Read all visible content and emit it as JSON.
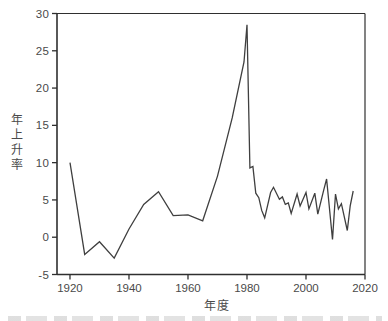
{
  "figure": {
    "background": "#ffffff",
    "axis_color": "#2f2f2f",
    "text_color": "#4a4a4a"
  },
  "chart_data": {
    "type": "line",
    "title": "",
    "xlabel": "年度",
    "ylabel": "年上升率",
    "x_ticks": [
      1920,
      1940,
      1960,
      1980,
      2000,
      2020
    ],
    "y_ticks": [
      30,
      25,
      20,
      15,
      10,
      5,
      0,
      -5
    ],
    "xlim": [
      1915.6,
      2020
    ],
    "ylim": [
      -5,
      30
    ],
    "grid": false,
    "legend": false,
    "line_color": "#3f3f3f",
    "series": [
      {
        "name": "年上升率",
        "points": [
          [
            1920,
            10.0
          ],
          [
            1925,
            -2.3
          ],
          [
            1930,
            -0.6
          ],
          [
            1935,
            -2.8
          ],
          [
            1940,
            1.1
          ],
          [
            1945,
            4.4
          ],
          [
            1950,
            6.1
          ],
          [
            1955,
            2.9
          ],
          [
            1960,
            3.0
          ],
          [
            1965,
            2.2
          ],
          [
            1970,
            8.2
          ],
          [
            1975,
            16.0
          ],
          [
            1979,
            23.5
          ],
          [
            1980,
            28.5
          ],
          [
            1981,
            9.3
          ],
          [
            1982,
            9.5
          ],
          [
            1983,
            5.9
          ],
          [
            1984,
            5.3
          ],
          [
            1985,
            3.6
          ],
          [
            1986,
            2.6
          ],
          [
            1988,
            6.0
          ],
          [
            1989,
            6.7
          ],
          [
            1991,
            5.1
          ],
          [
            1992,
            5.4
          ],
          [
            1993,
            4.4
          ],
          [
            1994,
            4.6
          ],
          [
            1995,
            3.2
          ],
          [
            1997,
            5.8
          ],
          [
            1998,
            4.2
          ],
          [
            2000,
            6.0
          ],
          [
            2001,
            3.8
          ],
          [
            2003,
            5.9
          ],
          [
            2004,
            3.1
          ],
          [
            2006,
            6.3
          ],
          [
            2007,
            7.8
          ],
          [
            2009,
            -0.3
          ],
          [
            2010,
            5.8
          ],
          [
            2011,
            3.8
          ],
          [
            2012,
            4.5
          ],
          [
            2014,
            0.9
          ],
          [
            2015,
            4.2
          ],
          [
            2016,
            6.2
          ]
        ]
      }
    ]
  }
}
